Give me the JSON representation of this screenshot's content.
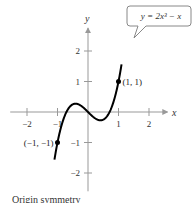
{
  "chart_data": {
    "type": "line",
    "title": "",
    "equation_label": "y = 2x³ − x",
    "xlabel": "x",
    "ylabel": "y",
    "xlim": [
      -2.5,
      2.5
    ],
    "ylim": [
      -2.5,
      2.7
    ],
    "x_ticks": [
      -2,
      -1,
      1,
      2
    ],
    "x_tick_labels": [
      "−2",
      "−1",
      "1",
      "2"
    ],
    "y_ticks": [
      -2,
      -1,
      1,
      2
    ],
    "y_tick_labels": [
      "−2",
      "−1",
      "1",
      "2"
    ],
    "grid": false,
    "series": [
      {
        "name": "y = 2x^3 - x",
        "function": "2*x^3 - x",
        "x_range": [
          -1.1,
          1.1
        ],
        "color": "#000000"
      }
    ],
    "points": [
      {
        "x": 1,
        "y": 1,
        "label": "(1, 1)"
      },
      {
        "x": -1,
        "y": -1,
        "label": "(−1, −1)"
      }
    ],
    "caption": "Origin symmetry"
  }
}
